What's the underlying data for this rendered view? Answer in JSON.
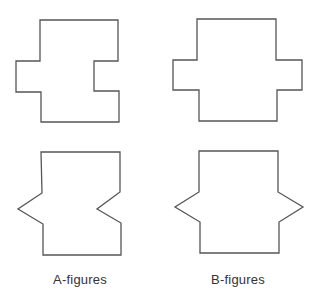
{
  "labels": {
    "a": "A-figures",
    "b": "B-figures"
  },
  "figures": [
    {
      "id": "A-top",
      "group": "A",
      "type": "rectangular notch right / rectangular protrusion left",
      "points": "40,20 118,20 118,61 94,61 94,91 119,91 119,122 41,122 41,92 16,92 16,61 40,61"
    },
    {
      "id": "B-top",
      "group": "B",
      "type": "rectangular protrusions both sides",
      "points": "197,19 276,19 276,60 302,60 302,90 277,90 277,121 199,121 199,90 173,90 173,60 197,60"
    },
    {
      "id": "A-bottom",
      "group": "A",
      "type": "triangular notch right / triangular point left",
      "points": "41,152 120,152 120,192 97,209 121,223 121,255 43,255 43,224 18,209 42,193"
    },
    {
      "id": "B-bottom",
      "group": "B",
      "type": "triangular points both sides",
      "points": "199,151 278,151 278,192 303,207 279,222 279,253 200,253 200,222 175,207 199,192"
    }
  ],
  "colors": {
    "stroke": "#555555",
    "background": "#ffffff",
    "text": "#333333"
  }
}
